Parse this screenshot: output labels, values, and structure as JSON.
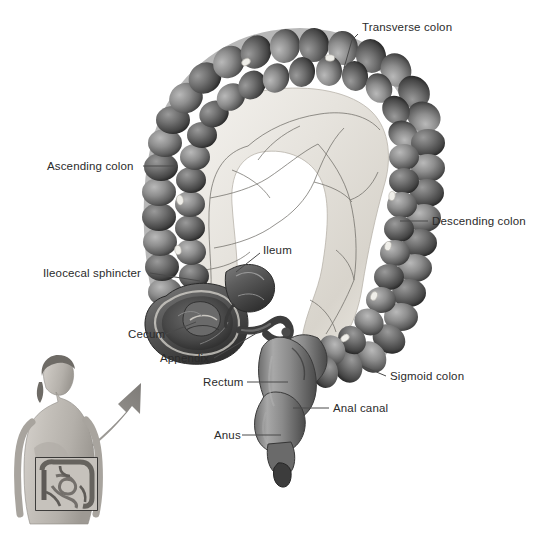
{
  "figure": {
    "background_color": "#ffffff",
    "label_color": "#2b2b2b",
    "leader_color": "#4a4a4a"
  },
  "labels": [
    {
      "id": "transverse-colon",
      "text": "Transverse colon",
      "x": 362,
      "y": 30,
      "anchor": "start"
    },
    {
      "id": "ascending-colon",
      "text": "Ascending colon",
      "x": 47,
      "y": 169,
      "anchor": "start"
    },
    {
      "id": "descending-colon",
      "text": "Descending colon",
      "x": 432,
      "y": 224,
      "anchor": "start"
    },
    {
      "id": "ileum",
      "text": "Ileum",
      "x": 263,
      "y": 253,
      "anchor": "start"
    },
    {
      "id": "ileocecal-sphincter",
      "text": "Ileocecal sphincter",
      "x": 43,
      "y": 276,
      "anchor": "start"
    },
    {
      "id": "cecum",
      "text": "Cecum",
      "x": 128,
      "y": 337,
      "anchor": "start"
    },
    {
      "id": "appendix",
      "text": "Appendix",
      "x": 160,
      "y": 361,
      "anchor": "start"
    },
    {
      "id": "sigmoid-colon",
      "text": "Sigmoid colon",
      "x": 390,
      "y": 379,
      "anchor": "start"
    },
    {
      "id": "rectum",
      "text": "Rectum",
      "x": 203,
      "y": 385,
      "anchor": "start"
    },
    {
      "id": "anal-canal",
      "text": "Anal canal",
      "x": 333,
      "y": 411,
      "anchor": "start"
    },
    {
      "id": "anus",
      "text": "Anus",
      "x": 214,
      "y": 438,
      "anchor": "start"
    }
  ],
  "leaders": [
    {
      "id": "leader-transverse-colon",
      "d": "M358,34 L352,40 L344,68"
    },
    {
      "id": "leader-ascending-colon",
      "d": "M143,166 L178,166"
    },
    {
      "id": "leader-descending-colon",
      "d": "M428,221 L400,221"
    },
    {
      "id": "leader-ileum",
      "d": "M260,253 L236,272"
    },
    {
      "id": "leader-ileocecal-sphincter",
      "d": "M150,273 L200,281"
    },
    {
      "id": "leader-cecum",
      "d": "M166,334 L196,322"
    },
    {
      "id": "leader-appendix",
      "d": "M214,358 L262,330"
    },
    {
      "id": "leader-sigmoid-colon",
      "d": "M386,376 L362,366"
    },
    {
      "id": "leader-rectum",
      "d": "M247,382 L288,382"
    },
    {
      "id": "leader-anal-canal",
      "d": "M329,408 L293,408"
    },
    {
      "id": "leader-anus",
      "d": "M242,435 L281,435"
    }
  ],
  "inset": {
    "id": "body-orientation-inset",
    "description": "Female torso showing abdominal region",
    "frame": {
      "x": 36,
      "y": 458,
      "width": 61,
      "height": 52
    },
    "arrow_tip": {
      "x": 141,
      "y": 383
    }
  },
  "anatomy_parts": [
    "transverse colon",
    "ascending colon",
    "descending colon",
    "sigmoid colon",
    "cecum",
    "appendix",
    "ileum",
    "ileocecal sphincter",
    "rectum",
    "anal canal",
    "anus",
    "mesentery",
    "haustra",
    "epiploic appendages"
  ]
}
